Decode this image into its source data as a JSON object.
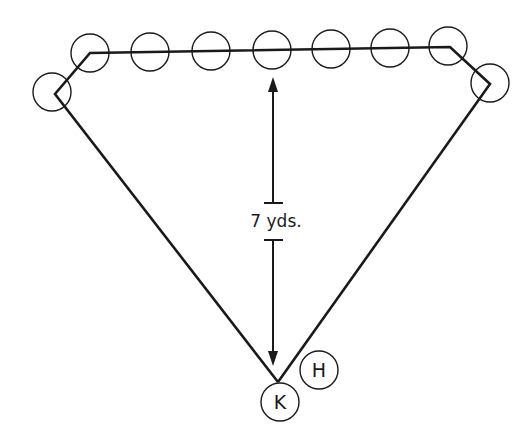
{
  "diagram": {
    "distance_label": "7 yds.",
    "kicker_label": "K",
    "holder_label": "H",
    "line_player_count": 9,
    "colors": {
      "ink": "#1a1a1a",
      "background": "#ffffff"
    }
  }
}
